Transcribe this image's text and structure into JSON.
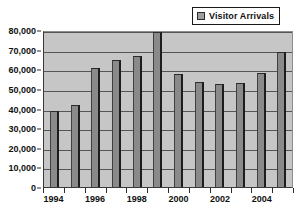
{
  "legend": {
    "swatch_name": "series-color-swatch",
    "label": "Visitor Arrivals",
    "position": "top-right"
  },
  "colors": {
    "plot_background": "#c6c6c6",
    "bar_fill": "#8a8a8a",
    "bar_shadow": "#1d1d1d",
    "gridline": "#555555",
    "axis": "#2d2d2d",
    "text": "#111111",
    "page_background": "#ffffff"
  },
  "chart_data": {
    "type": "bar",
    "title": "",
    "xlabel": "",
    "ylabel": "",
    "categories": [
      "1994",
      "1995",
      "1996",
      "1997",
      "1998",
      "1999",
      "2000",
      "2001",
      "2002",
      "2003",
      "2004",
      "2005"
    ],
    "values": [
      38500,
      42000,
      60500,
      64500,
      67000,
      79000,
      57500,
      53500,
      52500,
      53000,
      58000,
      69000
    ],
    "series": [
      {
        "name": "Visitor Arrivals",
        "values": [
          38500,
          42000,
          60500,
          64500,
          67000,
          79000,
          57500,
          53500,
          52500,
          53000,
          58000,
          69000
        ]
      }
    ],
    "ylim": [
      0,
      80000
    ],
    "ytick_values": [
      0,
      10000,
      20000,
      30000,
      40000,
      50000,
      60000,
      70000,
      80000
    ],
    "ytick_labels": [
      "0",
      "10,000",
      "20,000",
      "30,000",
      "40,000",
      "50,000",
      "60,000",
      "70,000",
      "80,000"
    ],
    "xtick_labels_shown": [
      "1994",
      "1996",
      "1998",
      "2000",
      "2002",
      "2004"
    ],
    "grid": true,
    "grid_axis": "y",
    "legend_position": "top-right"
  }
}
